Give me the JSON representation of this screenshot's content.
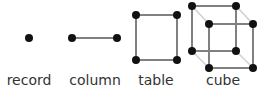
{
  "diagram": {
    "items": [
      {
        "label": "record",
        "x": 29
      },
      {
        "label": "column",
        "x": 95
      },
      {
        "label": "table",
        "x": 156
      },
      {
        "label": "cube",
        "x": 223
      }
    ],
    "colors": {
      "node": "#111111",
      "edge": "#808080",
      "hidden_edge": "#d0d0d0",
      "text": "#333333"
    }
  }
}
